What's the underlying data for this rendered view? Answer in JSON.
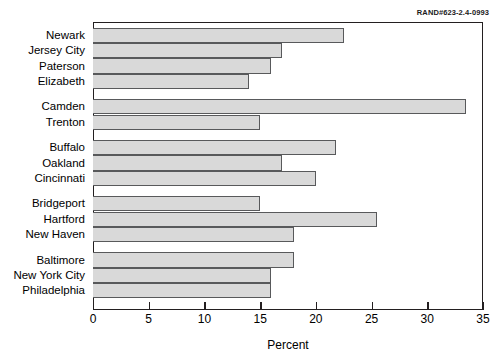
{
  "figure": {
    "rand_id": "RAND#623-2.4-0993",
    "xlabel": "Percent"
  },
  "chart_data": {
    "type": "bar",
    "orientation": "horizontal",
    "title": "",
    "subtitle": "",
    "xlabel": "Percent",
    "ylabel": "",
    "xlim": [
      0,
      35
    ],
    "xticks": [
      0,
      5,
      10,
      15,
      20,
      25,
      30,
      35
    ],
    "xtick_labels": [
      "0",
      "5",
      "10",
      "15",
      "20",
      "25",
      "30",
      "35"
    ],
    "grid": false,
    "legend": null,
    "bar_color": "#d9d9d9",
    "bar_edge_color": "#58595b",
    "groups": [
      {
        "name": "",
        "categories": [
          "Newark",
          "Jersey City",
          "Paterson",
          "Elizabeth"
        ],
        "values": [
          22.5,
          17.0,
          16.0,
          14.0
        ]
      },
      {
        "name": "",
        "categories": [
          "Camden",
          "Trenton"
        ],
        "values": [
          33.5,
          15.0
        ]
      },
      {
        "name": "",
        "categories": [
          "Buffalo",
          "Oakland",
          "Cincinnati"
        ],
        "values": [
          21.8,
          17.0,
          20.0
        ]
      },
      {
        "name": "",
        "categories": [
          "Bridgeport",
          "Hartford",
          "New Haven"
        ],
        "values": [
          15.0,
          25.5,
          18.0
        ]
      },
      {
        "name": "",
        "categories": [
          "Baltimore",
          "New York City",
          "Philadelphia"
        ],
        "values": [
          18.0,
          16.0,
          16.0
        ]
      }
    ],
    "categories": [
      "Newark",
      "Jersey City",
      "Paterson",
      "Elizabeth",
      "Camden",
      "Trenton",
      "Buffalo",
      "Oakland",
      "Cincinnati",
      "Bridgeport",
      "Hartford",
      "New Haven",
      "Baltimore",
      "New York City",
      "Philadelphia"
    ],
    "values": [
      22.5,
      17.0,
      16.0,
      14.0,
      33.5,
      15.0,
      21.8,
      17.0,
      20.0,
      15.0,
      25.5,
      18.0,
      18.0,
      16.0,
      16.0
    ]
  }
}
